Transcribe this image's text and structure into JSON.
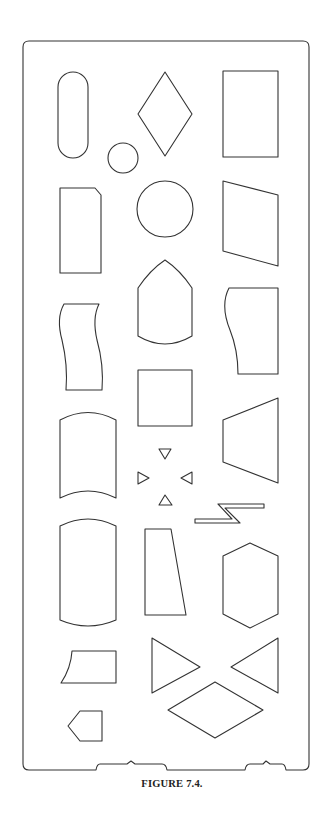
{
  "figure": {
    "caption": "FIGURE 7.4.",
    "stroke_color": "#333333",
    "background_color": "#ffffff"
  },
  "stencil": {
    "shapes": [
      {
        "name": "terminal-stadium",
        "row": 1,
        "col": 1
      },
      {
        "name": "connector-small-circle",
        "row": 1,
        "col": 1
      },
      {
        "name": "decision-diamond",
        "row": 1,
        "col": 2
      },
      {
        "name": "process-rectangle",
        "row": 1,
        "col": 3
      },
      {
        "name": "punched-card",
        "row": 2,
        "col": 1
      },
      {
        "name": "connector-circle",
        "row": 2,
        "col": 2
      },
      {
        "name": "manual-input-parallelogram",
        "row": 2,
        "col": 3
      },
      {
        "name": "off-page-connector-bullet",
        "row": 3,
        "col": 2
      },
      {
        "name": "punched-tape",
        "row": 3,
        "col": 1
      },
      {
        "name": "document-wavy-left",
        "row": 3,
        "col": 3
      },
      {
        "name": "auxiliary-square",
        "row": 4,
        "col": 2
      },
      {
        "name": "magnetic-drum-barrel",
        "row": 4,
        "col": 1
      },
      {
        "name": "manual-operation-trapezoid",
        "row": 4,
        "col": 3
      },
      {
        "name": "flow-arrows-small-triangles",
        "row": 5,
        "col": 2
      },
      {
        "name": "communication-link-bolt",
        "row": 5,
        "col": 3
      },
      {
        "name": "magnetic-tape-barrel",
        "row": 6,
        "col": 1
      },
      {
        "name": "tapered-trapezoid",
        "row": 6,
        "col": 2
      },
      {
        "name": "preparation-hexagon",
        "row": 6,
        "col": 3
      },
      {
        "name": "curved-left-card",
        "row": 7,
        "col": 1
      },
      {
        "name": "merge-triangle-right",
        "row": 7,
        "col": 2
      },
      {
        "name": "extract-triangle-left",
        "row": 7,
        "col": 3
      },
      {
        "name": "sort-wide-diamond",
        "row": 8,
        "col": 2
      },
      {
        "name": "off-page-pentagon",
        "row": 8,
        "col": 1
      }
    ]
  }
}
